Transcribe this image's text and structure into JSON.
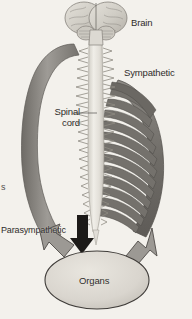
{
  "figure": {
    "background_color": "#f3f1ec",
    "text_color": "#2e2c2a",
    "labels": {
      "brain": "Brain",
      "sympathetic": "Sympathetic",
      "spinal_cord": "Spinal cord",
      "parasympathetic": "Parasympathetic",
      "organs": "Organs",
      "edge_fragment": "s"
    },
    "structures": {
      "brain": {
        "name": "brain-illustration",
        "fill": "#d6d3cc",
        "stroke": "#8a8680"
      },
      "spinal_cord": {
        "name": "spinal-cord-illustration",
        "fill": "#e8e5de",
        "stroke": "#9b978f"
      },
      "sympathetic_chain": {
        "name": "sympathetic-chain-illustration",
        "fill": "#7d7a75",
        "stroke": "#5b5854",
        "branch_count": 12
      },
      "parasympathetic_arc": {
        "name": "parasympathetic-arc",
        "fill": "#8d8a85",
        "stroke": "#6a6762"
      },
      "organs": {
        "name": "organs-ellipse",
        "fill": "#ddd9d2",
        "stroke": "#4a4744"
      },
      "black_arrow": {
        "name": "black-down-arrow",
        "fill": "#1c1a18"
      }
    }
  }
}
